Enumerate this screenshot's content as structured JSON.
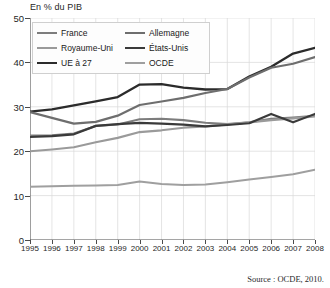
{
  "chart_data": {
    "type": "line",
    "title": "En % du PIB",
    "xlabel": "",
    "ylabel": "En % du PIB",
    "xlim": [
      1995,
      2008
    ],
    "ylim": [
      0,
      50
    ],
    "ytick_step": 10,
    "grid": true,
    "legend_position": "top-left",
    "source": "Source : OCDE, 2010.",
    "x": [
      1995,
      1996,
      1997,
      1998,
      1999,
      2000,
      2001,
      2002,
      2003,
      2004,
      2005,
      2006,
      2007,
      2008
    ],
    "yticks": [
      0,
      10,
      20,
      30,
      40,
      50
    ],
    "xticks": [
      1995,
      1996,
      1997,
      1998,
      1999,
      2000,
      2001,
      2002,
      2003,
      2004,
      2005,
      2006,
      2007,
      2008
    ],
    "series": [
      {
        "name": "France",
        "color": "#7d7d7d",
        "width": 2.1,
        "values": [
          23.5,
          23.6,
          24.0,
          25.7,
          26.0,
          27.2,
          27.3,
          27.0,
          26.4,
          26.1,
          26.5,
          27.3,
          27.6,
          28.0
        ]
      },
      {
        "name": "Royaume-Uni",
        "color": "#9a9a9a",
        "width": 2.1,
        "values": [
          20.0,
          20.4,
          20.9,
          22.0,
          23.0,
          24.3,
          24.7,
          25.3,
          25.6,
          26.0,
          26.5,
          27.0,
          27.4,
          27.8
        ]
      },
      {
        "name": "UE à 27",
        "color": "#2b2b2b",
        "width": 2.3,
        "values": [
          28.9,
          29.4,
          30.3,
          31.2,
          32.2,
          35.0,
          35.1,
          34.3,
          33.9,
          34.0,
          36.8,
          39.0,
          42.0,
          43.3
        ]
      },
      {
        "name": "Allemagne",
        "color": "#6e6e6e",
        "width": 2.2,
        "values": [
          28.8,
          27.5,
          26.2,
          26.6,
          28.0,
          30.4,
          31.2,
          32.0,
          33.1,
          34.0,
          36.6,
          38.8,
          39.7,
          41.2
        ]
      },
      {
        "name": "États-Unis",
        "color": "#3a3a3a",
        "width": 2.2,
        "values": [
          23.2,
          23.4,
          23.8,
          25.7,
          26.1,
          26.4,
          26.2,
          26.0,
          25.6,
          25.9,
          26.3,
          28.4,
          26.5,
          28.4
        ]
      },
      {
        "name": "OCDE",
        "color": "#9f9f9f",
        "width": 2.0,
        "values": [
          12.0,
          12.1,
          12.2,
          12.3,
          12.4,
          13.2,
          12.6,
          12.4,
          12.5,
          13.0,
          13.6,
          14.2,
          14.8,
          15.8
        ]
      }
    ]
  }
}
